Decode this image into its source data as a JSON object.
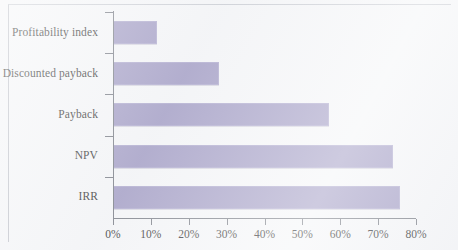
{
  "figure": {
    "background_color": "#f4f5f7",
    "bar_color": "#9d97c1",
    "axis_color": "#6f737c",
    "text_color": "#1d1d22"
  },
  "chart_data": {
    "type": "bar",
    "orientation": "horizontal",
    "title": "",
    "subtitle": "",
    "xlabel": "",
    "ylabel": "",
    "categories": [
      "IRR",
      "NPV",
      "Payback",
      "Discounted payback",
      "Profitability index"
    ],
    "values": [
      75.7,
      74.0,
      57.0,
      28.0,
      11.5
    ],
    "value_unit": "%",
    "xlim": [
      0,
      80
    ],
    "xticks": [
      0,
      10,
      20,
      30,
      40,
      50,
      60,
      70,
      80
    ],
    "xticklabels": [
      "0%",
      "10%",
      "20%",
      "30%",
      "40%",
      "50%",
      "60%",
      "70%",
      "80%"
    ],
    "grid": false,
    "legend": false,
    "legend_position": "none",
    "series": [
      {
        "name": "Percentage of firms using technique",
        "values": [
          75.7,
          74.0,
          57.0,
          28.0,
          11.5
        ]
      }
    ]
  }
}
